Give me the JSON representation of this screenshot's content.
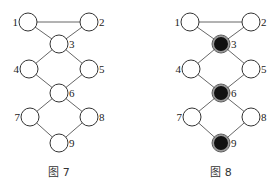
{
  "figures": [
    {
      "caption": "图 7",
      "offset_x": 0,
      "nodes": [
        {
          "id": "1",
          "x": 28,
          "y": 22,
          "filled": false,
          "label_side": "left"
        },
        {
          "id": "2",
          "x": 89,
          "y": 22,
          "filled": false,
          "label_side": "right"
        },
        {
          "id": "3",
          "x": 59,
          "y": 44,
          "filled": false,
          "label_side": "right"
        },
        {
          "id": "4",
          "x": 29,
          "y": 69,
          "filled": false,
          "label_side": "left"
        },
        {
          "id": "5",
          "x": 89,
          "y": 69,
          "filled": false,
          "label_side": "right"
        },
        {
          "id": "6",
          "x": 59,
          "y": 93,
          "filled": false,
          "label_side": "right"
        },
        {
          "id": "7",
          "x": 30,
          "y": 117,
          "filled": false,
          "label_side": "left"
        },
        {
          "id": "8",
          "x": 89,
          "y": 117,
          "filled": false,
          "label_side": "right"
        },
        {
          "id": "9",
          "x": 59,
          "y": 143,
          "filled": false,
          "label_side": "right"
        }
      ]
    },
    {
      "caption": "图 8",
      "offset_x": 162,
      "nodes": [
        {
          "id": "1",
          "x": 28,
          "y": 22,
          "filled": false,
          "label_side": "left"
        },
        {
          "id": "2",
          "x": 89,
          "y": 22,
          "filled": false,
          "label_side": "right"
        },
        {
          "id": "3",
          "x": 59,
          "y": 44,
          "filled": true,
          "label_side": "right"
        },
        {
          "id": "4",
          "x": 29,
          "y": 69,
          "filled": false,
          "label_side": "left"
        },
        {
          "id": "5",
          "x": 89,
          "y": 69,
          "filled": false,
          "label_side": "right"
        },
        {
          "id": "6",
          "x": 59,
          "y": 93,
          "filled": true,
          "label_side": "right"
        },
        {
          "id": "7",
          "x": 30,
          "y": 117,
          "filled": false,
          "label_side": "left"
        },
        {
          "id": "8",
          "x": 89,
          "y": 117,
          "filled": false,
          "label_side": "right"
        },
        {
          "id": "9",
          "x": 59,
          "y": 143,
          "filled": true,
          "label_side": "right"
        }
      ]
    }
  ],
  "edges": [
    [
      "1",
      "2"
    ],
    [
      "1",
      "3"
    ],
    [
      "2",
      "3"
    ],
    [
      "3",
      "4"
    ],
    [
      "3",
      "5"
    ],
    [
      "4",
      "6"
    ],
    [
      "5",
      "6"
    ],
    [
      "6",
      "7"
    ],
    [
      "6",
      "8"
    ],
    [
      "7",
      "9"
    ],
    [
      "8",
      "9"
    ]
  ],
  "node_radius": 9,
  "colors": {
    "edge": "#555555",
    "node_stroke": "#333333",
    "filled": "#111111",
    "ring": "#999999"
  }
}
